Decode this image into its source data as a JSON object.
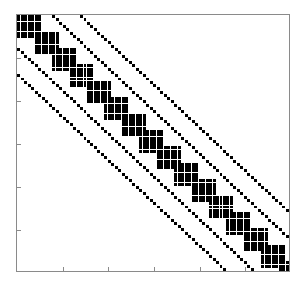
{
  "figure": {
    "title": "",
    "background": "#ffffff",
    "frame_color": "#8a8a8a",
    "marker_color": "#000000"
  },
  "chart_data": {
    "type": "scatter",
    "subtype": "spy-sparsity-pattern",
    "title": "",
    "subtitle": "",
    "xlabel": "",
    "ylabel": "",
    "grid": false,
    "legend": null,
    "legend_position": "none",
    "xlim": [
      0,
      78
    ],
    "ylim": [
      78,
      0
    ],
    "y_axis_inverted": true,
    "xticks": [
      0,
      13,
      26,
      39,
      52,
      65,
      78
    ],
    "yticks": [
      0,
      13,
      26,
      39,
      52,
      65,
      78
    ],
    "xticklabels": [
      "",
      "",
      "",
      "",
      "",
      "",
      ""
    ],
    "yticklabels": [
      "",
      "",
      "",
      "",
      "",
      "",
      ""
    ],
    "marker": "square",
    "marker_size_px": 3,
    "n_rows": 78,
    "n_cols": 78,
    "block_structure": {
      "block_size": 7,
      "block_step": 5,
      "n_blocks": 15
    },
    "thin_diagonals": [
      -18,
      -10,
      10,
      18
    ],
    "nnz_estimate": 1025
  }
}
